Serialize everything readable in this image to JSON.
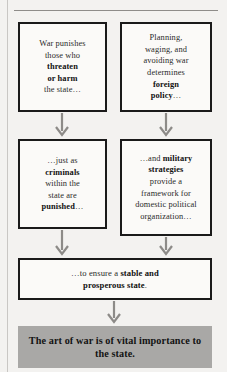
{
  "diagram": {
    "title_text": "",
    "background_color": "#f3f2f0",
    "box_border_color": "#1a1a1a",
    "banner_color": "#a9a8a6",
    "arrow_color": "#8d8b88",
    "nodes": [
      {
        "id": "war-punishes",
        "row": 1,
        "column": 1,
        "text_plain": "War punishes those who threaten or harm the state…",
        "segments": [
          {
            "text": "War punishes ",
            "bold": false
          },
          {
            "text": "those who ",
            "bold": false
          },
          {
            "text": "threaten ",
            "bold": true
          },
          {
            "text": "or harm ",
            "bold": true
          },
          {
            "text": "the state…",
            "bold": false
          }
        ]
      },
      {
        "id": "foreign-policy",
        "row": 1,
        "column": 2,
        "text_plain": "Planning, waging, and avoiding war determines foreign policy…",
        "segments": [
          {
            "text": "Planning, ",
            "bold": false
          },
          {
            "text": "waging, and ",
            "bold": false
          },
          {
            "text": "avoiding war ",
            "bold": false
          },
          {
            "text": "determines ",
            "bold": false
          },
          {
            "text": "foreign ",
            "bold": true
          },
          {
            "text": "policy",
            "bold": true
          },
          {
            "text": "…",
            "bold": false
          }
        ]
      },
      {
        "id": "criminals-punished",
        "row": 2,
        "column": 1,
        "text_plain": "…just as criminals within the state are punished…",
        "segments": [
          {
            "text": "…just as ",
            "bold": false
          },
          {
            "text": "criminals ",
            "bold": true
          },
          {
            "text": "within the ",
            "bold": false
          },
          {
            "text": "state are ",
            "bold": false
          },
          {
            "text": "punished",
            "bold": true
          },
          {
            "text": "…",
            "bold": false
          }
        ]
      },
      {
        "id": "military-strategies",
        "row": 2,
        "column": 2,
        "text_plain": "…and military strategies provide a framework for domestic political organization…",
        "segments": [
          {
            "text": "…and ",
            "bold": false
          },
          {
            "text": "military ",
            "bold": true
          },
          {
            "text": "strategies ",
            "bold": true
          },
          {
            "text": "provide a ",
            "bold": false
          },
          {
            "text": "framework for ",
            "bold": false
          },
          {
            "text": "domestic political ",
            "bold": false
          },
          {
            "text": "organization…",
            "bold": false
          }
        ]
      },
      {
        "id": "stable-prosperous-state",
        "row": 3,
        "column": 0,
        "text_plain": "…to ensure a stable and prosperous state.",
        "segments": [
          {
            "text": "…to ensure a ",
            "bold": false
          },
          {
            "text": "stable and ",
            "bold": true
          },
          {
            "text": "prosperous state",
            "bold": true
          },
          {
            "text": ".",
            "bold": false
          }
        ]
      }
    ],
    "conclusion_banner": {
      "id": "art-of-war-conclusion",
      "text_plain": "The art of war is of vital importance to the state."
    },
    "arrows": [
      {
        "id": "arrow-col1-row1-to-row2",
        "direction": "down"
      },
      {
        "id": "arrow-col2-row1-to-row2",
        "direction": "down"
      },
      {
        "id": "arrow-col1-row2-to-row3",
        "direction": "down"
      },
      {
        "id": "arrow-col2-row2-to-row3",
        "direction": "down"
      },
      {
        "id": "arrow-row3-to-banner",
        "direction": "down"
      }
    ]
  }
}
